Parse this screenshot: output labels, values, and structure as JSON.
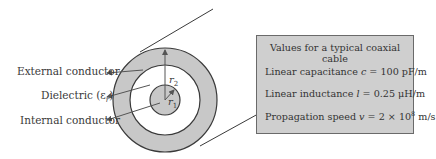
{
  "diagram": {
    "labels": {
      "external": "External conductor",
      "dielectric": "Dielectric (ε",
      "dielectric_sub": "r",
      "dielectric_close": ")",
      "internal": "Internal conductor",
      "r2": "r",
      "r2_sub": "2",
      "r1": "r",
      "r1_sub": "1"
    },
    "colors": {
      "conductor_fill": "#c8c8c8",
      "stroke": "#3a3a3a",
      "box_fill": "#cfcfcf"
    }
  },
  "values_box": {
    "title": "Values for a typical coaxial cable",
    "rows": [
      {
        "label": "Linear capacitance ",
        "symbol": "c",
        "value": " = 100 pF/m"
      },
      {
        "label": "Linear inductance ",
        "symbol": "l",
        "value": " = 0.25 μH/m"
      },
      {
        "label": "Propagation speed ",
        "symbol": "v",
        "value": " = 2 × 10",
        "sup": "8",
        "unit": " m/s"
      }
    ]
  }
}
